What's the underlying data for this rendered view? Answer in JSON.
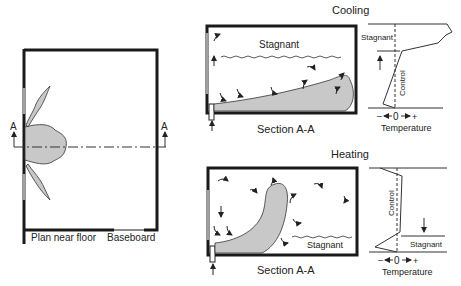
{
  "plan": {
    "caption_left": "Plan near floor",
    "caption_right": "Baseboard",
    "section_marker_left": "A",
    "section_marker_right": "A"
  },
  "cooling": {
    "title": "Cooling",
    "section_label": "Stagnant",
    "caption": "Section A-A",
    "graph": {
      "stagnant_label": "Stagnant",
      "control_label": "Control",
      "axis_minus": "–",
      "axis_zero": "0",
      "axis_plus": "+",
      "axis_label": "Temperature"
    }
  },
  "heating": {
    "title": "Heating",
    "section_label": "Stagnant",
    "caption": "Section A-A",
    "graph": {
      "stagnant_label": "Stagnant",
      "control_label": "Control",
      "axis_minus": "–",
      "axis_zero": "0",
      "axis_plus": "+",
      "axis_label": "Temperature"
    }
  },
  "colors": {
    "wall": "#1a1a1a",
    "airflow_fill": "#c8c8c8",
    "window": "#a0a0a0"
  }
}
